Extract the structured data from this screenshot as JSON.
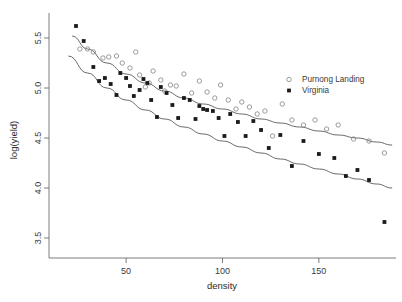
{
  "chart_data": {
    "type": "scatter",
    "title": "",
    "xlabel": "density",
    "ylabel": "log(yield)",
    "xlim": [
      10,
      190
    ],
    "ylim": [
      3.3,
      5.75
    ],
    "xticks": [
      50,
      100,
      150
    ],
    "yticks": [
      3.5,
      4.0,
      4.5,
      5.0,
      5.5
    ],
    "grid": false,
    "legend_position": "top-right",
    "series": [
      {
        "name": "Purnong Landing",
        "marker": "open-circle",
        "color": "#8a8a8a",
        "points": [
          [
            26,
            5.39
          ],
          [
            30,
            5.39
          ],
          [
            33,
            5.36
          ],
          [
            38,
            5.3
          ],
          [
            41,
            5.31
          ],
          [
            45,
            5.32
          ],
          [
            48,
            5.25
          ],
          [
            52,
            5.2
          ],
          [
            55,
            5.36
          ],
          [
            57,
            5.13
          ],
          [
            60,
            5.01
          ],
          [
            62,
            5.05
          ],
          [
            64,
            5.17
          ],
          [
            68,
            5.08
          ],
          [
            70,
            4.97
          ],
          [
            73,
            5.03
          ],
          [
            76,
            5.02
          ],
          [
            80,
            5.14
          ],
          [
            84,
            4.95
          ],
          [
            88,
            5.07
          ],
          [
            92,
            4.96
          ],
          [
            96,
            4.9
          ],
          [
            99,
            5.03
          ],
          [
            103,
            4.88
          ],
          [
            107,
            4.79
          ],
          [
            110,
            4.86
          ],
          [
            114,
            4.81
          ],
          [
            118,
            4.74
          ],
          [
            122,
            4.77
          ],
          [
            126,
            4.52
          ],
          [
            131,
            4.84
          ],
          [
            136,
            4.68
          ],
          [
            142,
            4.63
          ],
          [
            148,
            4.68
          ],
          [
            154,
            4.59
          ],
          [
            160,
            4.63
          ],
          [
            168,
            4.49
          ],
          [
            176,
            4.47
          ],
          [
            184,
            4.35
          ]
        ]
      },
      {
        "name": "Virginia",
        "marker": "filled-square",
        "color": "#1a1a1a",
        "points": [
          [
            24,
            5.62
          ],
          [
            28,
            5.47
          ],
          [
            33,
            5.21
          ],
          [
            36,
            5.07
          ],
          [
            39,
            5.1
          ],
          [
            42,
            5.04
          ],
          [
            45,
            4.93
          ],
          [
            47,
            5.15
          ],
          [
            50,
            5.1
          ],
          [
            52,
            5.02
          ],
          [
            54,
            4.92
          ],
          [
            57,
            4.98
          ],
          [
            59,
            5.09
          ],
          [
            61,
            5.05
          ],
          [
            63,
            4.88
          ],
          [
            66,
            4.71
          ],
          [
            68,
            5.01
          ],
          [
            71,
            4.95
          ],
          [
            74,
            4.83
          ],
          [
            77,
            4.7
          ],
          [
            80,
            4.9
          ],
          [
            83,
            4.88
          ],
          [
            86,
            4.69
          ],
          [
            88,
            4.82
          ],
          [
            90,
            4.79
          ],
          [
            92,
            4.78
          ],
          [
            95,
            4.77
          ],
          [
            98,
            4.7
          ],
          [
            101,
            4.52
          ],
          [
            104,
            4.74
          ],
          [
            108,
            4.66
          ],
          [
            112,
            4.52
          ],
          [
            116,
            4.67
          ],
          [
            120,
            4.58
          ],
          [
            124,
            4.4
          ],
          [
            130,
            4.53
          ],
          [
            136,
            4.22
          ],
          [
            142,
            4.47
          ],
          [
            150,
            4.34
          ],
          [
            158,
            4.3
          ],
          [
            164,
            4.12
          ],
          [
            170,
            4.18
          ],
          [
            176,
            4.08
          ],
          [
            184,
            3.66
          ]
        ]
      }
    ],
    "fitted_curves": [
      {
        "name": "Purnong Landing fit",
        "points": [
          [
            22,
            5.52
          ],
          [
            30,
            5.39
          ],
          [
            40,
            5.25
          ],
          [
            50,
            5.14
          ],
          [
            60,
            5.05
          ],
          [
            70,
            4.97
          ],
          [
            80,
            4.9
          ],
          [
            90,
            4.84
          ],
          [
            100,
            4.79
          ],
          [
            110,
            4.74
          ],
          [
            120,
            4.69
          ],
          [
            130,
            4.65
          ],
          [
            140,
            4.61
          ],
          [
            150,
            4.57
          ],
          [
            160,
            4.53
          ],
          [
            170,
            4.5
          ],
          [
            180,
            4.46
          ],
          [
            188,
            4.43
          ]
        ]
      },
      {
        "name": "Virginia fit",
        "points": [
          [
            20,
            5.32
          ],
          [
            30,
            5.15
          ],
          [
            40,
            5.0
          ],
          [
            50,
            4.88
          ],
          [
            60,
            4.78
          ],
          [
            70,
            4.69
          ],
          [
            80,
            4.61
          ],
          [
            90,
            4.54
          ],
          [
            100,
            4.47
          ],
          [
            110,
            4.41
          ],
          [
            120,
            4.35
          ],
          [
            130,
            4.29
          ],
          [
            140,
            4.24
          ],
          [
            150,
            4.19
          ],
          [
            160,
            4.14
          ],
          [
            170,
            4.09
          ],
          [
            180,
            4.04
          ],
          [
            188,
            4.0
          ]
        ]
      }
    ]
  },
  "axes": {
    "x_label": "density",
    "y_label": "log(yield)",
    "x_tick_labels": [
      "50",
      "100",
      "150"
    ],
    "y_tick_labels": [
      "3.5",
      "4.0",
      "4.5",
      "5.0",
      "5.5"
    ]
  },
  "legend": {
    "entries": [
      {
        "label": "Purnong Landing",
        "marker": "open-circle"
      },
      {
        "label": "Virginia",
        "marker": "filled-square"
      }
    ]
  }
}
